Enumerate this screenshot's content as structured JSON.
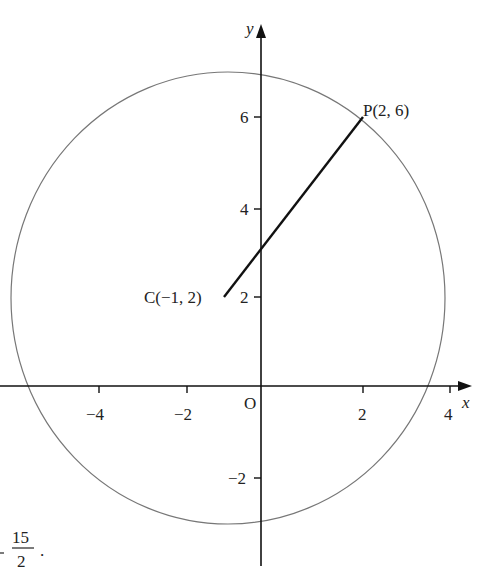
{
  "figure": {
    "axes": {
      "x_label": "x",
      "y_label": "y",
      "origin_label": "O",
      "x_ticks": [
        "−4",
        "−2",
        "2",
        "4"
      ],
      "y_ticks": [
        "6",
        "4",
        "2",
        "−2"
      ]
    },
    "points": {
      "C": "C(−1, 2)",
      "P": "P(2, 6)"
    },
    "fraction_fragment": {
      "numerator": "15",
      "denominator": "2",
      "trailing": "."
    },
    "colors": {
      "axis": "#111111",
      "circle": "#777777",
      "segment": "#111111"
    }
  }
}
